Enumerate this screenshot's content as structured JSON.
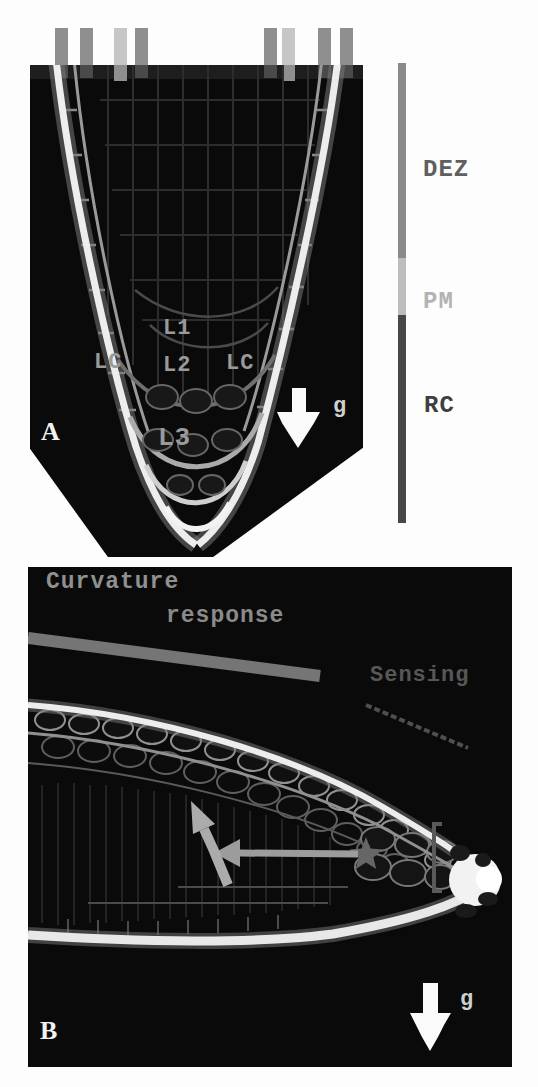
{
  "figure": {
    "panel_a": {
      "panel_label": "A",
      "gravity_label": "g",
      "layer_labels": {
        "l1": "L1",
        "l2": "L2",
        "l3": "L3",
        "lc_left": "LC",
        "lc_right": "LC"
      },
      "zone_bar": {
        "zones": [
          {
            "id": "dez",
            "label": "DEZ",
            "color": "#8a8a8a"
          },
          {
            "id": "pm",
            "label": "PM",
            "color": "#bdbdbd"
          },
          {
            "id": "rc",
            "label": "RC",
            "color": "#474747"
          }
        ]
      },
      "top_markers": {
        "pattern": [
          "dark",
          "dark",
          "light",
          "dark",
          "dark",
          "light",
          "dark",
          "dark"
        ],
        "dark_color": "#8f8f8f",
        "light_color": "#c6c6c6",
        "dark_stub_color": "#4a4a4a",
        "light_stub_color": "#8f8f8f"
      }
    },
    "panel_b": {
      "panel_label": "B",
      "gravity_label": "g",
      "annotations": {
        "curvature_line1": "Curvature",
        "curvature_line2": "response",
        "sensing": "Sensing"
      },
      "marker_colors": {
        "response_bar": "#757575",
        "sensing_line": "#4f4f4f",
        "arrow_gray": "#a8a8a8",
        "star": "#666666",
        "gravity_arrow": "#fafafa"
      }
    }
  }
}
